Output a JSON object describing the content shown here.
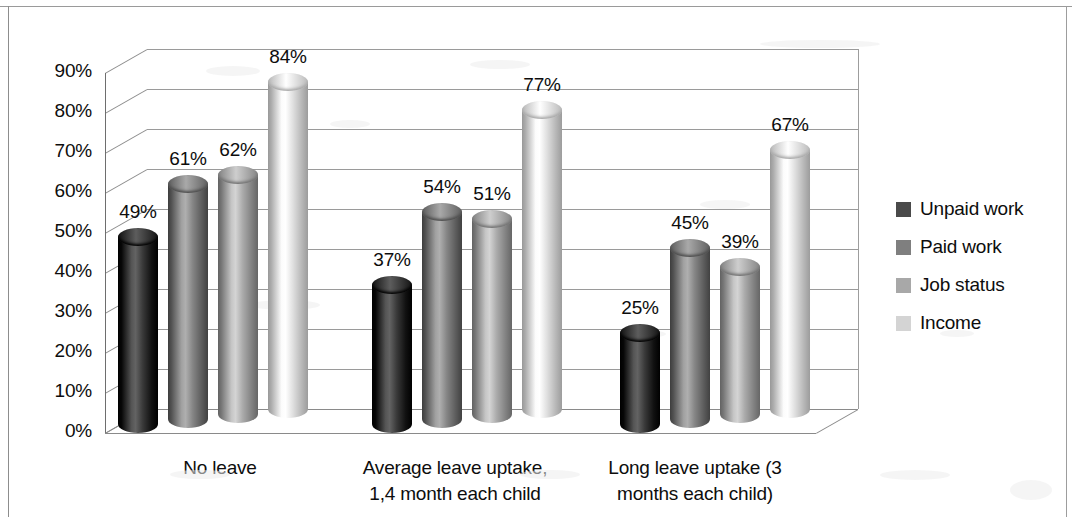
{
  "chart_data": {
    "type": "bar",
    "title": "",
    "subtitle": "",
    "xlabel": "",
    "ylabel": "",
    "ylim": [
      0,
      90
    ],
    "ytick_labels": [
      "90%",
      "80%",
      "70%",
      "60%",
      "50%",
      "40%",
      "30%",
      "20%",
      "10%",
      "0%"
    ],
    "ytick_values": [
      90,
      80,
      70,
      60,
      50,
      40,
      30,
      20,
      10,
      0
    ],
    "grid": true,
    "legend_position": "right",
    "categories": [
      "No leave",
      "Average leave uptake, 1,4 month each child",
      "Long leave uptake (3 months each child)"
    ],
    "category_lines": [
      [
        "No leave"
      ],
      [
        "Average leave uptake,",
        "1,4 month each child"
      ],
      [
        "Long leave uptake (3",
        "months each child)"
      ]
    ],
    "series": [
      {
        "name": "Unpaid work",
        "color": "#2f2f2f",
        "values": [
          49,
          37,
          25
        ],
        "labels": [
          "49%",
          "37%",
          "25%"
        ]
      },
      {
        "name": "Paid work",
        "color": "#7b7b7b",
        "values": [
          61,
          54,
          45
        ],
        "labels": [
          "61%",
          "54%",
          "45%"
        ]
      },
      {
        "name": "Job status",
        "color": "#a0a0a0",
        "values": [
          62,
          51,
          39
        ],
        "labels": [
          "62%",
          "51%",
          "39%"
        ]
      },
      {
        "name": "Income",
        "color": "#d6d6d6",
        "values": [
          84,
          77,
          67
        ],
        "labels": [
          "84%",
          "77%",
          "67%"
        ]
      }
    ],
    "legend": [
      {
        "label": "Unpaid work",
        "color": "#4a4a4a"
      },
      {
        "label": "Paid work",
        "color": "#7f7f7f"
      },
      {
        "label": "Job status",
        "color": "#a8a8a8"
      },
      {
        "label": "Income",
        "color": "#d4d4d4"
      }
    ]
  }
}
